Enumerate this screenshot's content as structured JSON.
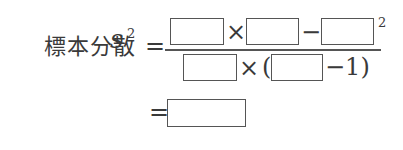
{
  "formula": {
    "label": "標本分散",
    "variable": "s",
    "variable_exponent": "2",
    "equals": "=",
    "numerator": {
      "times": "×",
      "minus": "−",
      "exponent": "2"
    },
    "denominator": {
      "times": "×",
      "open_paren": "(",
      "minus_one": "−1)"
    },
    "result_equals": "="
  }
}
